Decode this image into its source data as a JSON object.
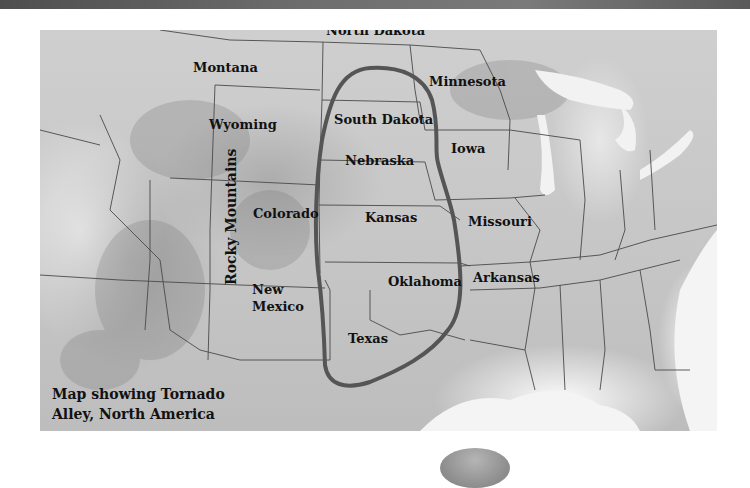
{
  "map": {
    "title": "Map showing Tornado Alley, North America",
    "caption_lines": [
      "Map showing Tornado",
      "Alley, North America"
    ],
    "region_outline": {
      "name": "Tornado Alley",
      "stroke_color": "#555555"
    },
    "labels": {
      "montana": "Montana",
      "north_dakota": "North Dakota",
      "minnesota": "Minnesota",
      "south_dakota": "South Dakota",
      "wyoming": "Wyoming",
      "iowa": "Iowa",
      "nebraska": "Nebraska",
      "colorado": "Colorado",
      "kansas": "Kansas",
      "missouri": "Missouri",
      "oklahoma": "Oklahoma",
      "arkansas": "Arkansas",
      "new_mexico_1": "New",
      "new_mexico_2": "Mexico",
      "texas": "Texas",
      "rocky_mountains": "Rocky Mountains"
    }
  },
  "colors": {
    "top_strip": "#5a5a5a",
    "map_base": "#c8c8c8",
    "outline": "#555555",
    "text": "#111111"
  }
}
